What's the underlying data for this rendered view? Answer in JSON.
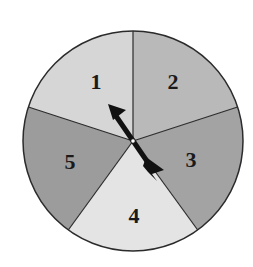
{
  "spinner": {
    "sections": [
      {
        "label": "1",
        "color": "#d6d6d6"
      },
      {
        "label": "2",
        "color": "#b9b9b9"
      },
      {
        "label": "3",
        "color": "#a3a3a3"
      },
      {
        "label": "4",
        "color": "#e4e4e4"
      },
      {
        "label": "5",
        "color": "#9c9c9c"
      }
    ],
    "pointer_target": "1",
    "outline_color": "#2b2b2b",
    "arrow_color": "#111111"
  }
}
